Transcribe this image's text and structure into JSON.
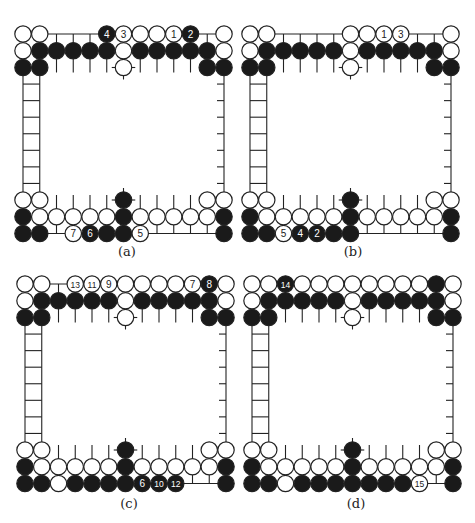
{
  "figure": {
    "type": "go-board-sequence",
    "grid": {
      "columns": 13,
      "top_rows": 3,
      "bottom_rows": 3,
      "ladder_rungs": 7,
      "spacing_px": 16.75
    },
    "colors": {
      "line": "#222222",
      "black_stone": "#1a1a1a",
      "white_stone": "#ffffff",
      "label_on_black": "#ffffff",
      "label_on_white": "#222222"
    },
    "panels": [
      {
        "id": "a",
        "caption": "(a)",
        "origin": {
          "x": 23,
          "top_y": 34,
          "bottom_y": 200
        },
        "top": [
          [
            {
              "c": 0,
              "s": "W"
            },
            {
              "c": 1,
              "s": "W"
            },
            {
              "c": 5,
              "s": "B",
              "n": "4"
            },
            {
              "c": 6,
              "s": "W",
              "n": "3"
            },
            {
              "c": 7,
              "s": "W"
            },
            {
              "c": 8,
              "s": "W"
            },
            {
              "c": 9,
              "s": "W",
              "n": "1"
            },
            {
              "c": 10,
              "s": "B",
              "n": "2"
            },
            {
              "c": 12,
              "s": "W"
            }
          ],
          [
            {
              "c": 0,
              "s": "W"
            },
            {
              "c": 1,
              "s": "B"
            },
            {
              "c": 2,
              "s": "B"
            },
            {
              "c": 3,
              "s": "B"
            },
            {
              "c": 4,
              "s": "B"
            },
            {
              "c": 5,
              "s": "B"
            },
            {
              "c": 6,
              "s": "W"
            },
            {
              "c": 7,
              "s": "B"
            },
            {
              "c": 8,
              "s": "B"
            },
            {
              "c": 9,
              "s": "B"
            },
            {
              "c": 10,
              "s": "B"
            },
            {
              "c": 11,
              "s": "B"
            },
            {
              "c": 12,
              "s": "W"
            }
          ],
          [
            {
              "c": 0,
              "s": "B"
            },
            {
              "c": 1,
              "s": "B"
            },
            {
              "c": 6,
              "s": "W"
            },
            {
              "c": 11,
              "s": "B"
            },
            {
              "c": 12,
              "s": "B"
            }
          ]
        ],
        "bottom": [
          [
            {
              "c": 0,
              "s": "W"
            },
            {
              "c": 1,
              "s": "W"
            },
            {
              "c": 6,
              "s": "B"
            },
            {
              "c": 11,
              "s": "W"
            },
            {
              "c": 12,
              "s": "W"
            }
          ],
          [
            {
              "c": 0,
              "s": "B"
            },
            {
              "c": 1,
              "s": "W"
            },
            {
              "c": 2,
              "s": "W"
            },
            {
              "c": 3,
              "s": "W"
            },
            {
              "c": 4,
              "s": "W"
            },
            {
              "c": 5,
              "s": "W"
            },
            {
              "c": 6,
              "s": "B"
            },
            {
              "c": 7,
              "s": "W"
            },
            {
              "c": 8,
              "s": "W"
            },
            {
              "c": 9,
              "s": "W"
            },
            {
              "c": 10,
              "s": "W"
            },
            {
              "c": 11,
              "s": "W"
            },
            {
              "c": 12,
              "s": "B"
            }
          ],
          [
            {
              "c": 0,
              "s": "B"
            },
            {
              "c": 1,
              "s": "B"
            },
            {
              "c": 3,
              "s": "W",
              "n": "7"
            },
            {
              "c": 4,
              "s": "B",
              "n": "6"
            },
            {
              "c": 5,
              "s": "B"
            },
            {
              "c": 6,
              "s": "B"
            },
            {
              "c": 7,
              "s": "W",
              "n": "5"
            },
            {
              "c": 12,
              "s": "B"
            }
          ]
        ]
      },
      {
        "id": "b",
        "caption": "(b)",
        "origin": {
          "x": 250,
          "top_y": 34,
          "bottom_y": 200
        },
        "top": [
          [
            {
              "c": 0,
              "s": "W"
            },
            {
              "c": 1,
              "s": "W"
            },
            {
              "c": 6,
              "s": "W"
            },
            {
              "c": 7,
              "s": "W"
            },
            {
              "c": 8,
              "s": "W",
              "n": "1"
            },
            {
              "c": 9,
              "s": "W",
              "n": "3"
            },
            {
              "c": 12,
              "s": "W"
            }
          ],
          [
            {
              "c": 0,
              "s": "W"
            },
            {
              "c": 1,
              "s": "B"
            },
            {
              "c": 2,
              "s": "B"
            },
            {
              "c": 3,
              "s": "B"
            },
            {
              "c": 4,
              "s": "B"
            },
            {
              "c": 5,
              "s": "B"
            },
            {
              "c": 6,
              "s": "W"
            },
            {
              "c": 7,
              "s": "B"
            },
            {
              "c": 8,
              "s": "B"
            },
            {
              "c": 9,
              "s": "B"
            },
            {
              "c": 10,
              "s": "B"
            },
            {
              "c": 11,
              "s": "B"
            },
            {
              "c": 12,
              "s": "W"
            }
          ],
          [
            {
              "c": 0,
              "s": "B"
            },
            {
              "c": 1,
              "s": "B"
            },
            {
              "c": 6,
              "s": "W"
            },
            {
              "c": 11,
              "s": "B"
            },
            {
              "c": 12,
              "s": "B"
            }
          ]
        ],
        "bottom": [
          [
            {
              "c": 0,
              "s": "W"
            },
            {
              "c": 1,
              "s": "W"
            },
            {
              "c": 6,
              "s": "B"
            },
            {
              "c": 11,
              "s": "W"
            },
            {
              "c": 12,
              "s": "W"
            }
          ],
          [
            {
              "c": 0,
              "s": "B"
            },
            {
              "c": 1,
              "s": "W"
            },
            {
              "c": 2,
              "s": "W"
            },
            {
              "c": 3,
              "s": "W"
            },
            {
              "c": 4,
              "s": "W"
            },
            {
              "c": 5,
              "s": "W"
            },
            {
              "c": 6,
              "s": "B"
            },
            {
              "c": 7,
              "s": "W"
            },
            {
              "c": 8,
              "s": "W"
            },
            {
              "c": 9,
              "s": "W"
            },
            {
              "c": 10,
              "s": "W"
            },
            {
              "c": 11,
              "s": "W"
            },
            {
              "c": 12,
              "s": "B"
            }
          ],
          [
            {
              "c": 0,
              "s": "B"
            },
            {
              "c": 1,
              "s": "B"
            },
            {
              "c": 2,
              "s": "W",
              "n": "5"
            },
            {
              "c": 3,
              "s": "B",
              "n": "4"
            },
            {
              "c": 4,
              "s": "B",
              "n": "2"
            },
            {
              "c": 5,
              "s": "B"
            },
            {
              "c": 6,
              "s": "B"
            },
            {
              "c": 12,
              "s": "B"
            }
          ]
        ]
      },
      {
        "id": "c",
        "caption": "(c)",
        "origin": {
          "x": 25,
          "top_y": 284,
          "bottom_y": 450
        },
        "top": [
          [
            {
              "c": 0,
              "s": "W"
            },
            {
              "c": 1,
              "s": "W"
            },
            {
              "c": 3,
              "s": "W",
              "n": "13"
            },
            {
              "c": 4,
              "s": "W",
              "n": "11"
            },
            {
              "c": 5,
              "s": "W",
              "n": "9"
            },
            {
              "c": 6,
              "s": "W"
            },
            {
              "c": 7,
              "s": "W"
            },
            {
              "c": 8,
              "s": "W"
            },
            {
              "c": 9,
              "s": "W"
            },
            {
              "c": 10,
              "s": "W",
              "n": "7"
            },
            {
              "c": 11,
              "s": "B",
              "n": "8"
            },
            {
              "c": 12,
              "s": "W"
            }
          ],
          [
            {
              "c": 0,
              "s": "W"
            },
            {
              "c": 1,
              "s": "B"
            },
            {
              "c": 2,
              "s": "B"
            },
            {
              "c": 3,
              "s": "B"
            },
            {
              "c": 4,
              "s": "B"
            },
            {
              "c": 5,
              "s": "B"
            },
            {
              "c": 6,
              "s": "W"
            },
            {
              "c": 7,
              "s": "B"
            },
            {
              "c": 8,
              "s": "B"
            },
            {
              "c": 9,
              "s": "B"
            },
            {
              "c": 10,
              "s": "B"
            },
            {
              "c": 11,
              "s": "B"
            },
            {
              "c": 12,
              "s": "W"
            }
          ],
          [
            {
              "c": 0,
              "s": "B"
            },
            {
              "c": 1,
              "s": "B"
            },
            {
              "c": 6,
              "s": "W"
            },
            {
              "c": 11,
              "s": "B"
            },
            {
              "c": 12,
              "s": "B"
            }
          ]
        ],
        "bottom": [
          [
            {
              "c": 0,
              "s": "W"
            },
            {
              "c": 1,
              "s": "W"
            },
            {
              "c": 6,
              "s": "B"
            },
            {
              "c": 11,
              "s": "W"
            },
            {
              "c": 12,
              "s": "W"
            }
          ],
          [
            {
              "c": 0,
              "s": "B"
            },
            {
              "c": 1,
              "s": "W"
            },
            {
              "c": 2,
              "s": "W"
            },
            {
              "c": 3,
              "s": "W"
            },
            {
              "c": 4,
              "s": "W"
            },
            {
              "c": 5,
              "s": "W"
            },
            {
              "c": 6,
              "s": "B"
            },
            {
              "c": 7,
              "s": "W"
            },
            {
              "c": 8,
              "s": "W"
            },
            {
              "c": 9,
              "s": "W"
            },
            {
              "c": 10,
              "s": "W"
            },
            {
              "c": 11,
              "s": "W"
            },
            {
              "c": 12,
              "s": "B"
            }
          ],
          [
            {
              "c": 0,
              "s": "B"
            },
            {
              "c": 1,
              "s": "B"
            },
            {
              "c": 2,
              "s": "W"
            },
            {
              "c": 3,
              "s": "B"
            },
            {
              "c": 4,
              "s": "B"
            },
            {
              "c": 5,
              "s": "B"
            },
            {
              "c": 6,
              "s": "B"
            },
            {
              "c": 7,
              "s": "B",
              "n": "6"
            },
            {
              "c": 8,
              "s": "B",
              "n": "10"
            },
            {
              "c": 9,
              "s": "B",
              "n": "12"
            },
            {
              "c": 12,
              "s": "B"
            }
          ]
        ]
      },
      {
        "id": "d",
        "caption": "(d)",
        "origin": {
          "x": 252,
          "top_y": 284,
          "bottom_y": 450
        },
        "top": [
          [
            {
              "c": 0,
              "s": "W"
            },
            {
              "c": 1,
              "s": "W"
            },
            {
              "c": 2,
              "s": "B",
              "n": "14"
            },
            {
              "c": 3,
              "s": "W"
            },
            {
              "c": 4,
              "s": "W"
            },
            {
              "c": 5,
              "s": "W"
            },
            {
              "c": 6,
              "s": "W"
            },
            {
              "c": 7,
              "s": "W"
            },
            {
              "c": 8,
              "s": "W"
            },
            {
              "c": 9,
              "s": "W"
            },
            {
              "c": 10,
              "s": "W"
            },
            {
              "c": 11,
              "s": "B"
            },
            {
              "c": 12,
              "s": "W"
            }
          ],
          [
            {
              "c": 0,
              "s": "W"
            },
            {
              "c": 1,
              "s": "B"
            },
            {
              "c": 2,
              "s": "B"
            },
            {
              "c": 3,
              "s": "B"
            },
            {
              "c": 4,
              "s": "B"
            },
            {
              "c": 5,
              "s": "B"
            },
            {
              "c": 6,
              "s": "W"
            },
            {
              "c": 7,
              "s": "B"
            },
            {
              "c": 8,
              "s": "B"
            },
            {
              "c": 9,
              "s": "B"
            },
            {
              "c": 10,
              "s": "B"
            },
            {
              "c": 11,
              "s": "B"
            },
            {
              "c": 12,
              "s": "W"
            }
          ],
          [
            {
              "c": 0,
              "s": "B"
            },
            {
              "c": 1,
              "s": "B"
            },
            {
              "c": 6,
              "s": "W"
            },
            {
              "c": 11,
              "s": "B"
            },
            {
              "c": 12,
              "s": "B"
            }
          ]
        ],
        "bottom": [
          [
            {
              "c": 0,
              "s": "W"
            },
            {
              "c": 1,
              "s": "W"
            },
            {
              "c": 6,
              "s": "B"
            },
            {
              "c": 11,
              "s": "W"
            },
            {
              "c": 12,
              "s": "W"
            }
          ],
          [
            {
              "c": 0,
              "s": "B"
            },
            {
              "c": 1,
              "s": "W"
            },
            {
              "c": 2,
              "s": "W"
            },
            {
              "c": 3,
              "s": "W"
            },
            {
              "c": 4,
              "s": "W"
            },
            {
              "c": 5,
              "s": "W"
            },
            {
              "c": 6,
              "s": "B"
            },
            {
              "c": 7,
              "s": "W"
            },
            {
              "c": 8,
              "s": "W"
            },
            {
              "c": 9,
              "s": "W"
            },
            {
              "c": 10,
              "s": "W"
            },
            {
              "c": 11,
              "s": "W"
            },
            {
              "c": 12,
              "s": "B"
            }
          ],
          [
            {
              "c": 0,
              "s": "B"
            },
            {
              "c": 1,
              "s": "B"
            },
            {
              "c": 2,
              "s": "W"
            },
            {
              "c": 3,
              "s": "B"
            },
            {
              "c": 4,
              "s": "B"
            },
            {
              "c": 5,
              "s": "B"
            },
            {
              "c": 6,
              "s": "B"
            },
            {
              "c": 7,
              "s": "B"
            },
            {
              "c": 8,
              "s": "B"
            },
            {
              "c": 9,
              "s": "B"
            },
            {
              "c": 10,
              "s": "W",
              "n": "15"
            },
            {
              "c": 12,
              "s": "B"
            }
          ]
        ]
      }
    ]
  }
}
